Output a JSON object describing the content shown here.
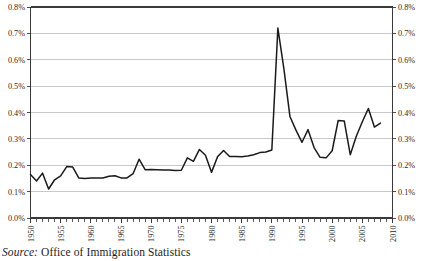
{
  "figure": {
    "source_note_label": "Source:",
    "source_note_text": " Office of Immigration Statistics",
    "background_color": "#ffffff",
    "line_color": "#1a1a1a",
    "grid_color": "#b5b5b5",
    "axis_color": "#3a3a3a"
  },
  "chart_data": {
    "type": "line",
    "title": "",
    "subtitle": "",
    "xlabel": "",
    "ylabel": "",
    "ylim": [
      0.0,
      0.8
    ],
    "xlim": [
      1950,
      2010
    ],
    "grid": true,
    "legend": false,
    "y_tick_labels": [
      "0.0%",
      "0.1%",
      "0.2%",
      "0.3%",
      "0.4%",
      "0.5%",
      "0.6%",
      "0.7%",
      "0.8%"
    ],
    "y_tick_values": [
      0.0,
      0.1,
      0.2,
      0.3,
      0.4,
      0.5,
      0.6,
      0.7,
      0.8
    ],
    "y_axis_right_labels": [
      "0.0%",
      "0.1%",
      "0.2%",
      "0.3%",
      "0.4%",
      "0.5%",
      "0.6%",
      "0.7%",
      "0.8%"
    ],
    "x_tick_labels": [
      "1950",
      "1955",
      "1960",
      "1965",
      "1970",
      "1975",
      "1980",
      "1985",
      "1990",
      "1995",
      "2000",
      "2005",
      "2010"
    ],
    "x_tick_values": [
      1950,
      1955,
      1960,
      1965,
      1970,
      1975,
      1980,
      1985,
      1990,
      1995,
      2000,
      2005,
      2010
    ],
    "x_minor_ticks_every": 1,
    "series": [
      {
        "name": "Immigration rate",
        "x": [
          1950,
          1951,
          1952,
          1953,
          1954,
          1955,
          1956,
          1957,
          1958,
          1959,
          1960,
          1961,
          1962,
          1963,
          1964,
          1965,
          1966,
          1967,
          1968,
          1969,
          1970,
          1971,
          1972,
          1973,
          1974,
          1975,
          1976,
          1977,
          1978,
          1979,
          1980,
          1981,
          1982,
          1983,
          1984,
          1985,
          1986,
          1987,
          1988,
          1989,
          1990,
          1991,
          1992,
          1993,
          1994,
          1995,
          1996,
          1997,
          1998,
          1999,
          2000,
          2001,
          2002,
          2003,
          2004,
          2005,
          2006,
          2007,
          2008
        ],
        "values": [
          0.165,
          0.14,
          0.17,
          0.11,
          0.145,
          0.16,
          0.195,
          0.193,
          0.152,
          0.15,
          0.152,
          0.152,
          0.152,
          0.158,
          0.16,
          0.152,
          0.152,
          0.168,
          0.223,
          0.183,
          0.184,
          0.183,
          0.182,
          0.182,
          0.18,
          0.181,
          0.228,
          0.215,
          0.26,
          0.238,
          0.173,
          0.232,
          0.256,
          0.233,
          0.233,
          0.232,
          0.235,
          0.24,
          0.248,
          0.25,
          0.258,
          0.72,
          0.565,
          0.385,
          0.333,
          0.287,
          0.335,
          0.267,
          0.23,
          0.228,
          0.255,
          0.37,
          0.368,
          0.24,
          0.31,
          0.365,
          0.415,
          0.345,
          0.36
        ]
      }
    ]
  }
}
